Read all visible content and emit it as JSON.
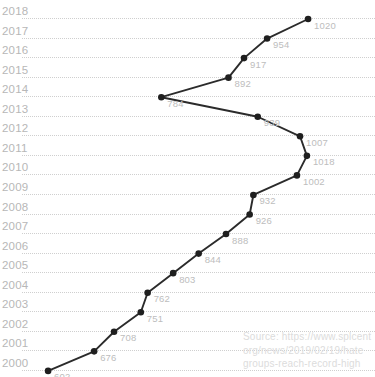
{
  "chart_data": {
    "type": "line",
    "title": "",
    "subtitle": "",
    "xlabel": "",
    "ylabel": "",
    "orientation": "value-on-x, year-on-y",
    "grid": true,
    "legend": null,
    "xlim": [
      560,
      1060
    ],
    "categories": [
      "2018",
      "2017",
      "2016",
      "2015",
      "2014",
      "2013",
      "2012",
      "2011",
      "2010",
      "2009",
      "2008",
      "2007",
      "2006",
      "2005",
      "2004",
      "2003",
      "2002",
      "2001",
      "2000"
    ],
    "values": [
      1020,
      954,
      917,
      892,
      784,
      939,
      1007,
      1018,
      1002,
      932,
      926,
      888,
      844,
      803,
      762,
      751,
      708,
      676,
      602
    ],
    "series": [
      {
        "name": "Hate groups",
        "points": [
          {
            "year": "2018",
            "value": 1020
          },
          {
            "year": "2017",
            "value": 954
          },
          {
            "year": "2016",
            "value": 917
          },
          {
            "year": "2015",
            "value": 892
          },
          {
            "year": "2014",
            "value": 784
          },
          {
            "year": "2013",
            "value": 939
          },
          {
            "year": "2012",
            "value": 1007
          },
          {
            "year": "2011",
            "value": 1018
          },
          {
            "year": "2010",
            "value": 1002
          },
          {
            "year": "2009",
            "value": 932
          },
          {
            "year": "2008",
            "value": 926
          },
          {
            "year": "2007",
            "value": 888
          },
          {
            "year": "2006",
            "value": 844
          },
          {
            "year": "2005",
            "value": 803
          },
          {
            "year": "2004",
            "value": 762
          },
          {
            "year": "2003",
            "value": 751
          },
          {
            "year": "2002",
            "value": 708
          },
          {
            "year": "2001",
            "value": 676
          },
          {
            "year": "2000",
            "value": 602
          }
        ]
      }
    ],
    "colors": {
      "line": "#2b2b2b",
      "marker": "#1f1f1f",
      "gridline": "#cfcfcf",
      "year_label": "#b7b7b7",
      "value_label": "#bdbdbd",
      "source_text": "#dcdcdc",
      "background": "#ffffff"
    }
  },
  "source": {
    "lines": [
      "Source: https://www.splcent",
      "org/news/2019/02/19/hate",
      "groups-reach-record-high"
    ]
  }
}
